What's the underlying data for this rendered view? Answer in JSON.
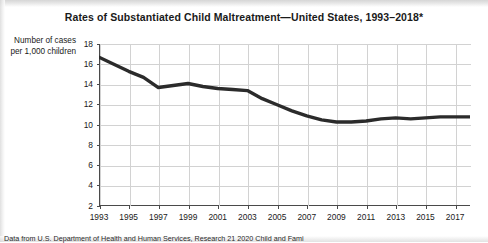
{
  "chart_data": {
    "type": "line",
    "title": "Rates of Substantiated Child Maltreatment—United States, 1993–2018*",
    "xlabel": "",
    "ylabel": "Number of cases per 1,000 children",
    "ylabel_lines": [
      "Number of cases",
      "per 1,000 children"
    ],
    "ylim": [
      2,
      18
    ],
    "ytick_step": 2,
    "yticks": [
      18,
      16,
      14,
      12,
      10,
      8,
      6,
      4,
      2
    ],
    "ytick_labels": [
      "18",
      "16",
      "14",
      "12",
      "10",
      "8",
      "6",
      "4",
      "2"
    ],
    "xlim": [
      1993,
      2018
    ],
    "xticks": [
      1993,
      1995,
      1997,
      1999,
      2001,
      2003,
      2005,
      2007,
      2009,
      2011,
      2013,
      2015,
      2017
    ],
    "xtick_labels": [
      "1993",
      "1995",
      "1997",
      "1999",
      "2001",
      "2003",
      "2005",
      "2007",
      "2009",
      "2011",
      "2013",
      "2015",
      "2017"
    ],
    "grid": true,
    "legend": false,
    "line_color": "#2b2b2b",
    "line_width": 3.4,
    "x": [
      1993,
      1994,
      1995,
      1996,
      1997,
      1998,
      1999,
      2000,
      2001,
      2002,
      2003,
      2004,
      2005,
      2006,
      2007,
      2008,
      2009,
      2010,
      2011,
      2012,
      2013,
      2014,
      2015,
      2016,
      2017,
      2018
    ],
    "values": [
      16.7,
      16.0,
      15.3,
      14.7,
      13.7,
      13.9,
      14.1,
      13.8,
      13.6,
      13.5,
      13.4,
      12.6,
      12.0,
      11.4,
      10.9,
      10.5,
      10.3,
      10.3,
      10.4,
      10.6,
      10.7,
      10.6,
      10.7,
      10.8,
      10.8,
      10.8
    ],
    "data_label_text": "",
    "annotations": []
  },
  "header": {
    "title": "Rates of Substantiated Child Maltreatment—United States, 1993–2018*"
  },
  "footer": {
    "source_note": "Data from U.S. Department of Health and Human Services, Research  21 2020  Child  and Fami"
  }
}
